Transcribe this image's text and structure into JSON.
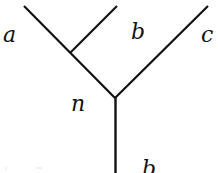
{
  "diagram": {
    "type": "tree",
    "stroke_color": "#111111",
    "background": "#ffffff",
    "labels": {
      "a": "a",
      "b": "b",
      "c": "c",
      "n": "n",
      "bottom": "b"
    },
    "edges": [
      {
        "name": "edge-a",
        "from": "leaf-a",
        "to": "vertex-n"
      },
      {
        "name": "edge-b",
        "from": "leaf-b",
        "to": "junction-ab"
      },
      {
        "name": "edge-c",
        "from": "leaf-c",
        "to": "vertex-n"
      },
      {
        "name": "edge-root",
        "from": "vertex-n",
        "to": "root"
      }
    ]
  }
}
